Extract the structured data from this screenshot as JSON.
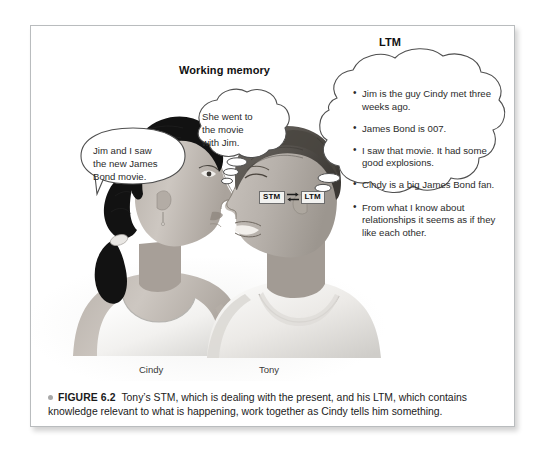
{
  "figure": {
    "number_label": "FIGURE 6.2",
    "caption": "Tony’s STM, which is dealing with the present, and his LTM, which contains knowledge relevant to what is happening, work together as Cindy tells him something."
  },
  "headings": {
    "working_memory": "Working memory",
    "ltm": "LTM"
  },
  "people": [
    {
      "name": "Cindy",
      "role": "speaker",
      "hair": "dark ponytail",
      "garment": "white tank top"
    },
    {
      "name": "Tony",
      "role": "listener",
      "hair": "short dark hair",
      "garment": "white t-shirt"
    }
  ],
  "speech_bubble": {
    "speaker": "Cindy",
    "text": "Jim and I saw\nthe new James\nBond movie."
  },
  "working_memory_bubble": {
    "owner": "Tony",
    "text": "She went to\nthe movie\nwith Jim."
  },
  "ltm_bubble": {
    "owner": "Tony",
    "items": [
      "Jim is the guy Cindy met three weeks ago.",
      "James Bond is 007.",
      "I saw that movie. It had some good explosions.",
      "Cindy is a big James Bond fan.",
      "From what I know about relationships it seems as if they like each other."
    ]
  },
  "memory_boxes": {
    "stm": "STM",
    "ltm": "LTM",
    "connector": "bidirectional-arrows"
  },
  "colors": {
    "panel_border": "#b9bcbe",
    "text": "#2b2b2b",
    "caption_bullet": "#a8a8a8",
    "box_fill": "#f2f2f0",
    "box_border": "#6d6d6d",
    "skin": "#c9c3bd",
    "hair_cindy": "#141414",
    "hair_tony": "#55504b",
    "shirt": "#f4f4f2"
  }
}
